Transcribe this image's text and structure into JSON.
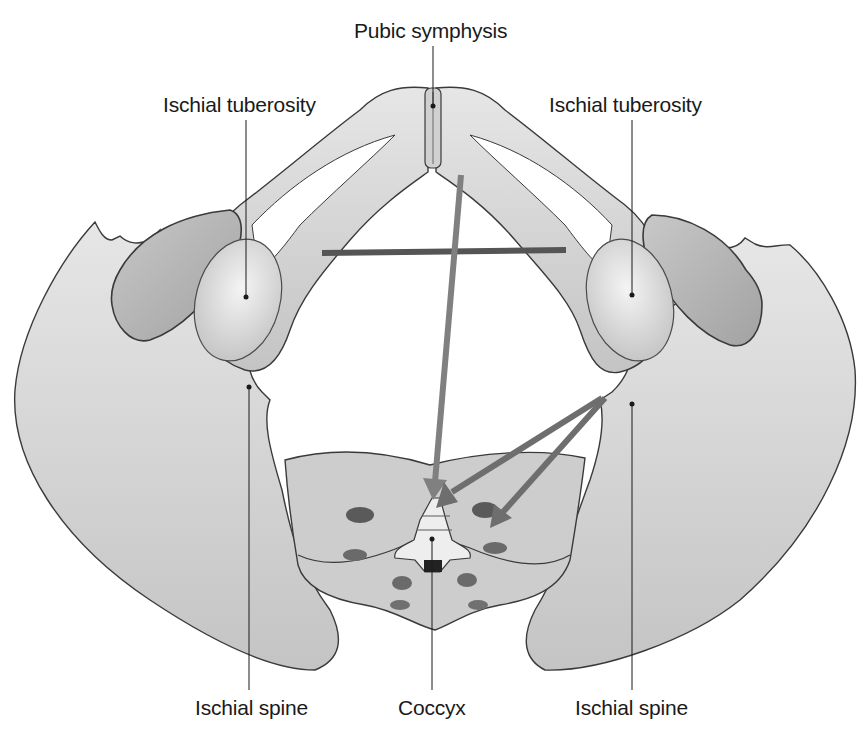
{
  "figure": {
    "labels": {
      "pubic_symphysis": "Pubic symphysis",
      "ischial_tuberosity_left": "Ischial tuberosity",
      "ischial_tuberosity_right": "Ischial tuberosity",
      "ischial_spine_left": "Ischial spine",
      "coccyx": "Coccyx",
      "ischial_spine_right": "Ischial spine"
    },
    "colors": {
      "bone_fill": "#d9d9d9",
      "bone_shadow": "#a8a8a8",
      "bone_highlight": "#f2f2f2",
      "outline": "#3a3a3a",
      "foramen_fill": "#b5b5b5",
      "transverse_diameter_line": "#555555",
      "anteroposterior_arrow": "#808080",
      "spine_arrows": "#6e6e6e",
      "leader_line": "#1a1a1a",
      "label_text": "#1a1a1a"
    },
    "measurement_lines": [
      {
        "name": "intertuberous-diameter",
        "from": [
          322,
          253
        ],
        "to": [
          566,
          250
        ]
      },
      {
        "name": "anteroposterior-diameter",
        "from": [
          461,
          175
        ],
        "to": [
          433,
          497
        ]
      },
      {
        "name": "spine-to-coccyx",
        "from": [
          600,
          398
        ],
        "to": [
          436,
          500
        ]
      },
      {
        "name": "spine-to-sacrum",
        "from": [
          605,
          398
        ],
        "to": [
          492,
          525
        ]
      }
    ]
  }
}
